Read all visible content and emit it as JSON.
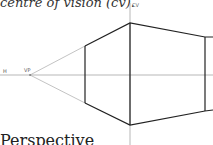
{
  "captions": {
    "top": "centre of vision (cv).",
    "bottom": "Perspective"
  },
  "labels": {
    "horizon": "H",
    "vanishing_point": "VP",
    "centre_of_vision": "CV"
  },
  "colors": {
    "construction_line": "#9a9a9a",
    "outline": "#222222"
  }
}
